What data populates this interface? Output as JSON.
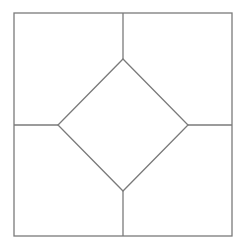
{
  "diagram": {
    "width": 246,
    "height": 248,
    "background": "#ffffff",
    "stroke_color": "#7a7a7a",
    "stroke_width": 1.3,
    "outer_square": {
      "x1": 14,
      "y1": 13,
      "x2": 232,
      "y2": 236
    },
    "diamond": {
      "top": [
        123,
        59
      ],
      "right": [
        188,
        125
      ],
      "bottom": [
        123,
        191
      ],
      "left": [
        58,
        125
      ]
    },
    "connectors": [
      {
        "name": "top",
        "from": [
          123,
          13
        ],
        "to": [
          123,
          59
        ]
      },
      {
        "name": "right",
        "from": [
          188,
          125
        ],
        "to": [
          232,
          125
        ]
      },
      {
        "name": "bottom",
        "from": [
          123,
          191
        ],
        "to": [
          123,
          236
        ]
      },
      {
        "name": "left",
        "from": [
          14,
          125
        ],
        "to": [
          58,
          125
        ]
      }
    ]
  }
}
